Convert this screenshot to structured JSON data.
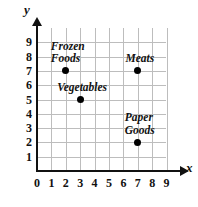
{
  "chart_data": {
    "type": "scatter",
    "title": "",
    "xlabel": "x",
    "ylabel": "y",
    "xlim": [
      0,
      9
    ],
    "ylim": [
      0,
      9
    ],
    "grid": true,
    "legend": "none",
    "x_ticks": [
      "0",
      "1",
      "2",
      "3",
      "4",
      "5",
      "6",
      "7",
      "8",
      "9"
    ],
    "y_ticks": [
      "1",
      "2",
      "3",
      "4",
      "5",
      "6",
      "7",
      "8",
      "9"
    ],
    "origin_label": "0",
    "points": [
      {
        "label": "Frozen Foods",
        "label_lines": [
          "Frozen",
          "Foods"
        ],
        "x": 2,
        "y": 7
      },
      {
        "label": "Vegetables",
        "label_lines": [
          "Vegetables"
        ],
        "x": 3,
        "y": 5
      },
      {
        "label": "Meats",
        "label_lines": [
          "Meats"
        ],
        "x": 7,
        "y": 7
      },
      {
        "label": "Paper Goods",
        "label_lines": [
          "Paper",
          "Goods"
        ],
        "x": 7,
        "y": 2
      }
    ],
    "colors": {
      "point": "#000000",
      "axis": "#111111",
      "grid": "#bdbdbd",
      "background": "#ffffff",
      "text": "#111111"
    }
  }
}
